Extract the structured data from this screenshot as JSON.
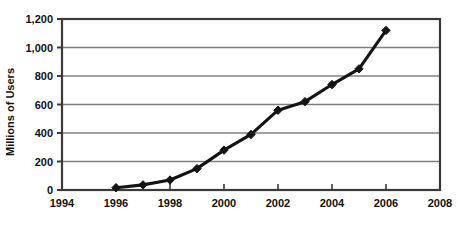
{
  "chart_data": {
    "type": "line",
    "title": "",
    "xlabel": "",
    "ylabel": "Millions of Users",
    "x": [
      1996,
      1997,
      1998,
      1999,
      2000,
      2001,
      2002,
      2003,
      2004,
      2005,
      2006
    ],
    "values": [
      16,
      36,
      70,
      150,
      280,
      390,
      560,
      620,
      740,
      850,
      1120
    ],
    "series": [
      {
        "name": "Millions of Users",
        "values": [
          16,
          36,
          70,
          150,
          280,
          390,
          560,
          620,
          740,
          850,
          1120
        ]
      }
    ],
    "xlim": [
      1994,
      2008
    ],
    "ylim": [
      0,
      1200
    ],
    "xticks": [
      1994,
      1996,
      1998,
      2000,
      2002,
      2004,
      2006,
      2008
    ],
    "xticklabels": [
      "1994",
      "1996",
      "1998",
      "2000",
      "2002",
      "2004",
      "2006",
      "2008"
    ],
    "yticks": [
      0,
      200,
      400,
      600,
      800,
      1000,
      1200
    ],
    "yticklabels": [
      "0",
      "200",
      "400",
      "600",
      "800",
      "1,000",
      "1,200"
    ],
    "grid": true,
    "grid_axis": "y",
    "legend": false,
    "legend_position": "none",
    "marker": "diamond",
    "line_color": "#141414",
    "marker_color": "#141414",
    "grid_color": "#808080",
    "axis_color": "#3a3a3a",
    "background_color": "#ffffff"
  },
  "axis": {
    "y_title": "Millions of Users"
  }
}
